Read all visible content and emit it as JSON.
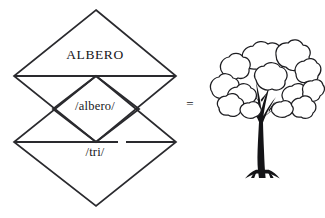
{
  "diagram": {
    "type": "semiotic-sign-diagram",
    "background_color": "#ffffff",
    "stroke_color": "#2a2a2e",
    "labels": {
      "word": "ALBERO",
      "phonemic": "/albero/",
      "phonetic": "/tri/"
    },
    "relation_symbol": "=",
    "referent": {
      "icon_name": "tree-illustration",
      "description": "deciduous tree line drawing"
    },
    "shapes": [
      {
        "name": "upper-diamond",
        "cx": 96,
        "cy": 76,
        "half_width": 82,
        "half_height": 66
      },
      {
        "name": "middle-diamond",
        "cx": 96,
        "cy": 109,
        "half_width": 43,
        "half_height": 33
      },
      {
        "name": "lower-diamond",
        "cx": 96,
        "cy": 142,
        "half_width": 82,
        "half_height": 64
      }
    ]
  }
}
